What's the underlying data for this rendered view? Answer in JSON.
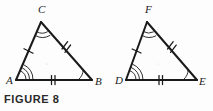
{
  "figure": {
    "caption": "FIGURE 8",
    "type": "geometry-diagram",
    "ink_color": "#1a1a1a",
    "background_color": "#fdfdfd",
    "triangles": [
      {
        "name": "triangle-ABC",
        "vertices": [
          {
            "label": "A",
            "x": 16,
            "y": 80,
            "label_x": 6,
            "label_y": 84,
            "angle_arcs": 3
          },
          {
            "label": "B",
            "x": 92,
            "y": 80,
            "label_x": 95,
            "label_y": 85,
            "angle_arcs": 1
          },
          {
            "label": "C",
            "x": 41,
            "y": 22,
            "label_x": 38,
            "label_y": 13,
            "angle_arcs": 2
          }
        ],
        "sides": [
          {
            "name": "side-AC",
            "from": "A",
            "to": "C",
            "ticks": 1
          },
          {
            "name": "side-CB",
            "from": "C",
            "to": "B",
            "ticks": 2
          },
          {
            "name": "side-AB",
            "from": "A",
            "to": "B",
            "ticks": 2
          }
        ]
      },
      {
        "name": "triangle-DEF",
        "vertices": [
          {
            "label": "D",
            "x": 126,
            "y": 80,
            "label_x": 115,
            "label_y": 84,
            "angle_arcs": 3
          },
          {
            "label": "E",
            "x": 197,
            "y": 80,
            "label_x": 199,
            "label_y": 85,
            "angle_arcs": 1
          },
          {
            "label": "F",
            "x": 147,
            "y": 22,
            "label_x": 145,
            "label_y": 13,
            "angle_arcs": 2
          }
        ],
        "sides": [
          {
            "name": "side-DF",
            "from": "D",
            "to": "F",
            "ticks": 1
          },
          {
            "name": "side-FE",
            "from": "F",
            "to": "E",
            "ticks": 2
          },
          {
            "name": "side-DE",
            "from": "D",
            "to": "E",
            "ticks": 2
          }
        ]
      }
    ]
  }
}
